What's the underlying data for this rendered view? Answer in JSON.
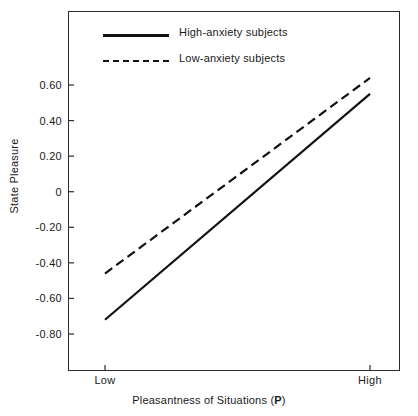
{
  "chart_data": {
    "type": "line",
    "title": "",
    "xlabel": "Pleasantness of Situations (P)",
    "xlabel_plain": "Pleasantness of Situations (",
    "xlabel_bold": "P",
    "xlabel_tail": ")",
    "ylabel": "State Pleasure",
    "categories": [
      "Low",
      "High"
    ],
    "x": [
      0,
      1
    ],
    "xlim": [
      0,
      1
    ],
    "ylim": [
      -0.95,
      0.72
    ],
    "grid": false,
    "legend_position": "top-left-inside",
    "yticks": [
      0.6,
      0.4,
      0.2,
      0,
      -0.2,
      -0.4,
      -0.6,
      -0.8
    ],
    "ytick_labels": [
      "0.60",
      "0.40",
      "0.20",
      "0",
      "-0.20",
      "-0.40",
      "-0.60",
      "-0.80"
    ],
    "xtick_labels": [
      "Low",
      "High"
    ],
    "series": [
      {
        "name": "High-anxiety subjects",
        "style": "solid",
        "color": "#111111",
        "values": [
          -0.72,
          0.55
        ]
      },
      {
        "name": "Low-anxiety subjects",
        "style": "dashed",
        "color": "#111111",
        "values": [
          -0.46,
          0.64
        ]
      }
    ]
  },
  "legend": {
    "items": [
      {
        "label": "High-anxiety subjects",
        "style": "solid"
      },
      {
        "label": "Low-anxiety subjects",
        "style": "dashed"
      }
    ]
  },
  "axes": {
    "y_title": "State Pleasure",
    "x_title_prefix": "Pleasantness of Situations (",
    "x_title_bold": "P",
    "x_title_suffix": ")",
    "y_labels": [
      "0.60",
      "0.40",
      "0.20",
      "0",
      "-0.20",
      "-0.40",
      "-0.60",
      "-0.80"
    ],
    "x_labels": [
      "Low",
      "High"
    ]
  },
  "colors": {
    "line": "#111111",
    "frame": "#2b2b2b",
    "text": "#1a1a1a",
    "background": "#ffffff"
  }
}
